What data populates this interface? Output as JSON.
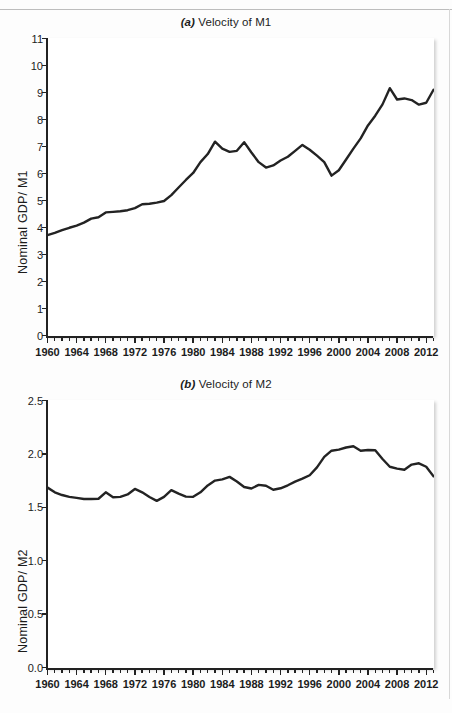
{
  "page": {
    "background": "#fdfdfd",
    "line_color": "#232323",
    "axis_color": "#222222"
  },
  "panels": [
    {
      "id": "a",
      "tag": "(a)",
      "title": "Velocity of M1",
      "ylabel": "Nominal GDP/ M1"
    },
    {
      "id": "b",
      "tag": "(b)",
      "title": "Velocity of M2",
      "ylabel": "Nominal GDP/ M2"
    }
  ],
  "chart_data": [
    {
      "type": "line",
      "title": "(a) Velocity of M1",
      "xlabel": "",
      "ylabel": "Nominal GDP/ M1",
      "xlim": [
        1960,
        2013
      ],
      "ylim": [
        0,
        11
      ],
      "yticks": [
        0,
        1,
        2,
        3,
        4,
        5,
        6,
        7,
        8,
        9,
        10,
        11
      ],
      "ytick_labels": [
        "0",
        "1",
        "2",
        "3",
        "4",
        "5",
        "6",
        "7",
        "8",
        "9",
        "10",
        "11"
      ],
      "xticks": [
        1960,
        1964,
        1968,
        1972,
        1976,
        1980,
        1984,
        1988,
        1992,
        1996,
        2000,
        2004,
        2008,
        2012
      ],
      "xtick_labels": [
        "1960",
        "1964",
        "1968",
        "1972",
        "1976",
        "1980",
        "1984",
        "1988",
        "1992",
        "1996",
        "2000",
        "2004",
        "2008",
        "2012"
      ],
      "minor_xtick_interval": 1,
      "grid": false,
      "legend": false,
      "x": [
        1960,
        1961,
        1962,
        1963,
        1964,
        1965,
        1966,
        1967,
        1968,
        1969,
        1970,
        1971,
        1972,
        1973,
        1974,
        1975,
        1976,
        1977,
        1978,
        1979,
        1980,
        1981,
        1982,
        1983,
        1984,
        1985,
        1986,
        1987,
        1988,
        1989,
        1990,
        1991,
        1992,
        1993,
        1994,
        1995,
        1996,
        1997,
        1998,
        1999,
        2000,
        2001,
        2002,
        2003,
        2004,
        2005,
        2006,
        2007,
        2008,
        2009,
        2010,
        2011,
        2012,
        2013
      ],
      "values": [
        3.72,
        3.78,
        3.88,
        3.96,
        4.06,
        4.18,
        4.32,
        4.38,
        4.56,
        4.58,
        4.62,
        4.72,
        4.86,
        4.88,
        4.93,
        4.98,
        5.2,
        5.42,
        5.68,
        5.94,
        6.2,
        6.5,
        6.7,
        6.82,
        7.18,
        6.9,
        6.8,
        6.85,
        7.16,
        6.82,
        6.44,
        6.22,
        6.3,
        6.48,
        6.6,
        6.82,
        7.06,
        6.9,
        6.7,
        6.5,
        5.92,
        6.1,
        6.5,
        6.9,
        7.3,
        7.76,
        8.1,
        8.5,
        9.16,
        8.74,
        8.76,
        8.7,
        8.55,
        8.6
      ],
      "values_note": "series continues: 2006 peak 10.28, declining to 6.78 at 2013",
      "series": [
        {
          "name": "Velocity of M1",
          "points": [
            [
              1960,
              3.72
            ],
            [
              1961,
              3.8
            ],
            [
              1962,
              3.9
            ],
            [
              1963,
              3.99
            ],
            [
              1964,
              4.07
            ],
            [
              1965,
              4.18
            ],
            [
              1966,
              4.33
            ],
            [
              1967,
              4.38
            ],
            [
              1968,
              4.56
            ],
            [
              1969,
              4.58
            ],
            [
              1970,
              4.6
            ],
            [
              1971,
              4.64
            ],
            [
              1972,
              4.72
            ],
            [
              1973,
              4.86
            ],
            [
              1974,
              4.88
            ],
            [
              1975,
              4.92
            ],
            [
              1976,
              4.98
            ],
            [
              1977,
              5.2
            ],
            [
              1978,
              5.48
            ],
            [
              1979,
              5.76
            ],
            [
              1980,
              6.02
            ],
            [
              1981,
              6.42
            ],
            [
              1982,
              6.72
            ],
            [
              1983,
              7.18
            ],
            [
              1984,
              6.92
            ],
            [
              1985,
              6.8
            ],
            [
              1986,
              6.84
            ],
            [
              1987,
              7.16
            ],
            [
              1988,
              6.78
            ],
            [
              1989,
              6.42
            ],
            [
              1990,
              6.22
            ],
            [
              1991,
              6.3
            ],
            [
              1992,
              6.48
            ],
            [
              1993,
              6.62
            ],
            [
              1994,
              6.84
            ],
            [
              1995,
              7.06
            ],
            [
              1996,
              6.88
            ],
            [
              1997,
              6.66
            ],
            [
              1998,
              6.42
            ],
            [
              1999,
              5.92
            ],
            [
              2000,
              6.12
            ],
            [
              2001,
              6.52
            ],
            [
              2002,
              6.92
            ],
            [
              2003,
              7.3
            ],
            [
              2004,
              7.78
            ],
            [
              2005,
              8.14
            ],
            [
              2006,
              8.56
            ],
            [
              2007,
              9.16
            ],
            [
              2008,
              8.74
            ],
            [
              2009,
              8.78
            ],
            [
              2010,
              8.72
            ],
            [
              2011,
              8.55
            ],
            [
              2012,
              8.62
            ],
            [
              2013,
              9.1
            ]
          ]
        }
      ]
    },
    {
      "type": "line",
      "title": "(b) Velocity of M2",
      "xlabel": "",
      "ylabel": "Nominal GDP/ M2",
      "xlim": [
        1960,
        2013
      ],
      "ylim": [
        0.0,
        2.5
      ],
      "yticks": [
        0.0,
        0.5,
        1.0,
        1.5,
        2.0,
        2.5
      ],
      "ytick_labels": [
        "0.0",
        "0.5",
        "1.0",
        "1.5",
        "2.0",
        "2.5"
      ],
      "xticks": [
        1960,
        1964,
        1968,
        1972,
        1976,
        1980,
        1984,
        1988,
        1992,
        1996,
        2000,
        2004,
        2008,
        2012
      ],
      "xtick_labels": [
        "1960",
        "1964",
        "1968",
        "1972",
        "1976",
        "1980",
        "1984",
        "1988",
        "1992",
        "1996",
        "2000",
        "2004",
        "2008",
        "2012"
      ],
      "minor_xtick_interval": 1,
      "grid": false,
      "legend": false,
      "series": [
        {
          "name": "Velocity of M2",
          "points": [
            [
              1960,
              1.685
            ],
            [
              1961,
              1.64
            ],
            [
              1962,
              1.615
            ],
            [
              1963,
              1.598
            ],
            [
              1964,
              1.588
            ],
            [
              1965,
              1.578
            ],
            [
              1966,
              1.578
            ],
            [
              1967,
              1.58
            ],
            [
              1968,
              1.64
            ],
            [
              1969,
              1.594
            ],
            [
              1970,
              1.598
            ],
            [
              1971,
              1.62
            ],
            [
              1972,
              1.672
            ],
            [
              1973,
              1.64
            ],
            [
              1974,
              1.597
            ],
            [
              1975,
              1.56
            ],
            [
              1976,
              1.598
            ],
            [
              1977,
              1.66
            ],
            [
              1978,
              1.628
            ],
            [
              1979,
              1.6
            ],
            [
              1980,
              1.598
            ],
            [
              1981,
              1.64
            ],
            [
              1982,
              1.705
            ],
            [
              1983,
              1.75
            ],
            [
              1984,
              1.762
            ],
            [
              1985,
              1.785
            ],
            [
              1986,
              1.742
            ],
            [
              1987,
              1.69
            ],
            [
              1988,
              1.676
            ],
            [
              1989,
              1.71
            ],
            [
              1990,
              1.702
            ],
            [
              1991,
              1.664
            ],
            [
              1992,
              1.678
            ],
            [
              1993,
              1.706
            ],
            [
              1994,
              1.74
            ],
            [
              1995,
              1.768
            ],
            [
              1996,
              1.8
            ],
            [
              1997,
              1.874
            ],
            [
              1998,
              1.972
            ],
            [
              1999,
              2.03
            ],
            [
              2000,
              2.04
            ],
            [
              2001,
              2.06
            ],
            [
              2002,
              2.072
            ],
            [
              2003,
              2.03
            ],
            [
              2004,
              2.036
            ],
            [
              2005,
              2.034
            ],
            [
              2006,
              1.952
            ],
            [
              2007,
              1.88
            ],
            [
              2008,
              1.862
            ],
            [
              2009,
              1.852
            ],
            [
              2010,
              1.9
            ],
            [
              2011,
              1.912
            ],
            [
              2012,
              1.88
            ],
            [
              2013,
              1.79
            ]
          ]
        }
      ]
    }
  ]
}
